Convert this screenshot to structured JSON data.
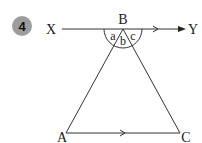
{
  "question": {
    "number": "4",
    "badge_color": "#9d9d9d"
  },
  "diagram": {
    "points": {
      "X": "X",
      "Y": "Y",
      "B": "B",
      "A": "A",
      "C": "C"
    },
    "angles": {
      "a": "a",
      "b": "b",
      "c": "c"
    },
    "line_color": "#333333"
  }
}
